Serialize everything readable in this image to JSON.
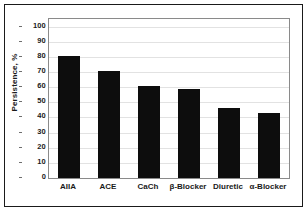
{
  "figure": {
    "frame_color": "#1a1a1a",
    "plot_border_color": "#8a8a8a",
    "background": "#ffffff"
  },
  "chart_data": {
    "type": "bar",
    "title": "",
    "subtitle": "",
    "xlabel": "",
    "ylabel": "Persistence, %",
    "categories": [
      "AIIA",
      "ACE",
      "CaCh",
      "β-Blocker",
      "Diuretic",
      "α-Blocker"
    ],
    "values": [
      80.5,
      70.5,
      61,
      59,
      46,
      43
    ],
    "series": [
      {
        "name": "Persistence",
        "values": [
          80.5,
          70.5,
          61,
          59,
          46,
          43
        ],
        "color": "#0d0d0d"
      }
    ],
    "ylim": [
      0,
      105
    ],
    "yticks": [
      0,
      10,
      20,
      30,
      40,
      50,
      60,
      70,
      80,
      90,
      100
    ],
    "ytick_labels": [
      "0",
      "10",
      "20",
      "30",
      "40",
      "50",
      "60",
      "70",
      "80",
      "90",
      "100"
    ],
    "grid": "horizontal",
    "gridline_color": "#e2e2e2",
    "legend": "none",
    "legend_position": "none",
    "bar_color": "#0d0d0d",
    "annotations": []
  }
}
